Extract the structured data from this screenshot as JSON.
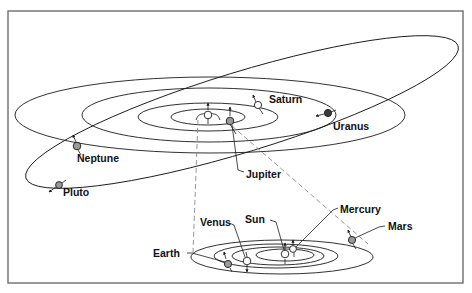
{
  "diagram": {
    "type": "solar-system-orbits",
    "colors": {
      "frame": "#6e6e6e",
      "orbit": "#1a1a1a",
      "projection_dash": "#8a8a8a",
      "planet_light": "#ffffff",
      "planet_gray": "#9a9a9a",
      "planet_dark": "#3a3a3a"
    },
    "outer_system": {
      "labels": {
        "saturn": "Saturn",
        "uranus": "Uranus",
        "neptune": "Neptune",
        "pluto": "Pluto",
        "jupiter": "Jupiter"
      }
    },
    "inner_system": {
      "labels": {
        "mercury": "Mercury",
        "venus": "Venus",
        "sun": "Sun",
        "earth": "Earth",
        "mars": "Mars"
      }
    }
  }
}
